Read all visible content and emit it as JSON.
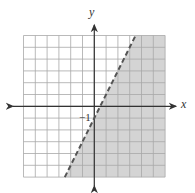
{
  "chart_data": {
    "type": "line",
    "title": "",
    "xlabel": "x",
    "ylabel": "y",
    "xlim": [
      -6,
      6
    ],
    "ylim": [
      -6,
      6
    ],
    "grid": true,
    "grid_step": 1,
    "annotations": [
      {
        "text": "−1",
        "x": 0,
        "y": -1,
        "meaning": "y-intercept label"
      }
    ],
    "series": [
      {
        "name": "boundary line",
        "equation": "y = 2x - 1",
        "style": "dashed",
        "x": [
          -2.5,
          3.5
        ],
        "y": [
          -6,
          6
        ]
      }
    ],
    "shaded_region": {
      "inequality": "y < 2x - 1",
      "side": "below-right of line",
      "color": "#d4d4d4"
    }
  },
  "labels": {
    "x_axis": "x",
    "y_axis": "y",
    "intercept": "−1"
  },
  "colors": {
    "grid": "#a8a8a8",
    "shade": "#d4d4d4",
    "axis": "#333333",
    "line": "#555555"
  }
}
